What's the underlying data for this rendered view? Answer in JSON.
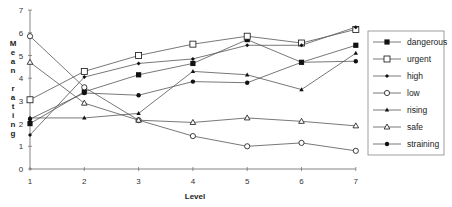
{
  "chart_data": {
    "type": "line",
    "title": "",
    "xlabel": "Level",
    "ylabel": "Mean rating",
    "x": [
      1,
      2,
      3,
      4,
      5,
      6,
      7
    ],
    "ylim": [
      0,
      7
    ],
    "yticks": [
      0,
      1,
      2,
      3,
      4,
      5,
      6,
      7
    ],
    "grid": false,
    "legend_position": "right",
    "series": [
      {
        "name": "dangerous",
        "marker": "filled-square",
        "values": [
          2.0,
          3.4,
          4.15,
          4.65,
          5.7,
          4.7,
          5.45
        ]
      },
      {
        "name": "urgent",
        "marker": "open-square",
        "values": [
          3.05,
          4.3,
          5.0,
          5.5,
          5.85,
          5.55,
          6.15
        ]
      },
      {
        "name": "high",
        "marker": "small-filled-diamond",
        "values": [
          1.5,
          4.05,
          4.65,
          4.85,
          5.45,
          5.45,
          6.25
        ]
      },
      {
        "name": "low",
        "marker": "open-diamond",
        "values": [
          5.85,
          3.6,
          2.15,
          1.45,
          1.0,
          1.15,
          0.8
        ]
      },
      {
        "name": "rising",
        "marker": "filled-triangle",
        "values": [
          2.25,
          2.25,
          2.45,
          4.3,
          4.15,
          3.5,
          5.1
        ]
      },
      {
        "name": "safe",
        "marker": "open-triangle",
        "values": [
          4.7,
          2.9,
          2.15,
          2.05,
          2.25,
          2.1,
          1.9
        ]
      },
      {
        "name": "straining",
        "marker": "filled-circle",
        "values": [
          2.2,
          3.35,
          3.25,
          3.85,
          3.8,
          4.7,
          4.75
        ]
      }
    ]
  },
  "axis": {
    "x_title": "Level",
    "y_title_letters": [
      "M",
      "e",
      "a",
      "n",
      "",
      "r",
      "a",
      "t",
      "i",
      "n",
      "g"
    ]
  },
  "colors": {
    "line": "#555555",
    "marker": "#111111",
    "axis": "#666666"
  }
}
